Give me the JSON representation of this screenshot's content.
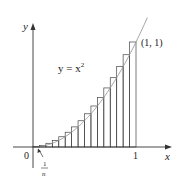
{
  "diagram": {
    "curve_label": "y = x",
    "curve_exp": "2",
    "point_label": "(1, 1)",
    "x_axis_label": "x",
    "y_axis_label": "y",
    "origin_label": "0",
    "x_tick_label": "1",
    "width_num": "1",
    "width_den": "n",
    "num_rectangles": 16,
    "colors": {
      "axis": "#333333",
      "rect": "#444444",
      "curve": "#999999"
    }
  }
}
